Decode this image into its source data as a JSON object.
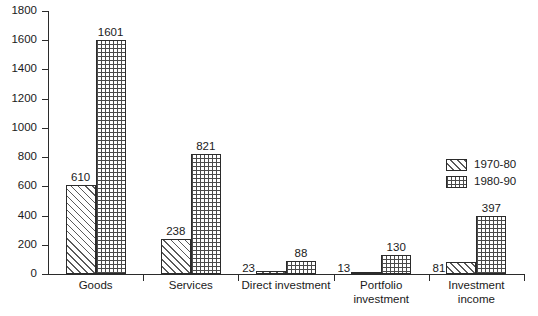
{
  "chart_data": {
    "type": "bar",
    "title": "",
    "subtitle": "",
    "xlabel": "",
    "ylabel": "",
    "ylim": [
      0,
      1800
    ],
    "ytick_step": 200,
    "ytick_labels": [
      "1800",
      "1600",
      "1400",
      "1200",
      "1000",
      "800",
      "600",
      "400",
      "200",
      "0"
    ],
    "ytick_values": [
      1800,
      1600,
      1400,
      1200,
      1000,
      800,
      600,
      400,
      200,
      0
    ],
    "grid": false,
    "legend_position": "right-middle",
    "categories": [
      "Goods",
      "Services",
      "Direct investment",
      "Portfolio investment",
      "Investment income"
    ],
    "category_label_lines": [
      [
        "Goods"
      ],
      [
        "Services"
      ],
      [
        "Direct investment"
      ],
      [
        "Portfolio",
        "investment"
      ],
      [
        "Investment",
        "income"
      ]
    ],
    "series": [
      {
        "name": "1970-80",
        "pattern": "diagonal-hatch",
        "values": [
          610,
          238,
          23,
          13,
          81
        ]
      },
      {
        "name": "1980-90",
        "pattern": "dot-grid",
        "values": [
          1601,
          821,
          88,
          130,
          397
        ]
      }
    ],
    "data_labels": [
      "610",
      "1601",
      "238",
      "821",
      "23",
      "88",
      "13",
      "130",
      "81",
      "397"
    ],
    "colors": {
      "axis": "#2b2b2b",
      "pattern": "#4a4a4a",
      "background": "#ffffff",
      "text": "#1a1a1a"
    }
  },
  "legend": {
    "items": [
      {
        "label": "1970-80"
      },
      {
        "label": "1980-90"
      }
    ]
  }
}
